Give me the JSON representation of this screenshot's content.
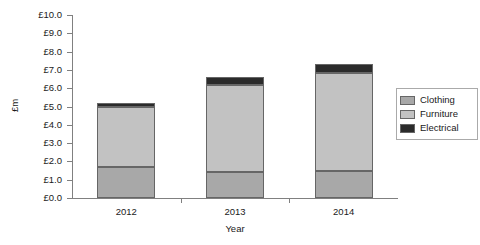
{
  "chart_data": {
    "type": "bar",
    "title": "",
    "subtitle": "",
    "xlabel": "Year",
    "ylabel": "£m",
    "categories": [
      "2012",
      "2013",
      "2014"
    ],
    "stacked": true,
    "series": [
      {
        "name": "Clothing",
        "values": [
          1.7,
          1.4,
          1.45
        ],
        "color": "#a8a8a8"
      },
      {
        "name": "Furniture",
        "values": [
          3.3,
          4.75,
          5.4
        ],
        "color": "#c2c2c2"
      },
      {
        "name": "Electrical",
        "values": [
          0.2,
          0.45,
          0.45
        ],
        "color": "#2b2b2b"
      }
    ],
    "totals": [
      5.2,
      6.6,
      7.3
    ],
    "ylim": [
      0.0,
      10.0
    ],
    "ytick_labels": [
      "£0.0",
      "£1.0",
      "£2.0",
      "£3.0",
      "£4.0",
      "£5.0",
      "£6.0",
      "£7.0",
      "£8.0",
      "£9.0",
      "£10.0"
    ],
    "ytick_values": [
      0,
      1,
      2,
      3,
      4,
      5,
      6,
      7,
      8,
      9,
      10
    ],
    "grid": false,
    "legend_position": "right",
    "axis_color": "#808080",
    "bar_edge_color": "#666666"
  }
}
